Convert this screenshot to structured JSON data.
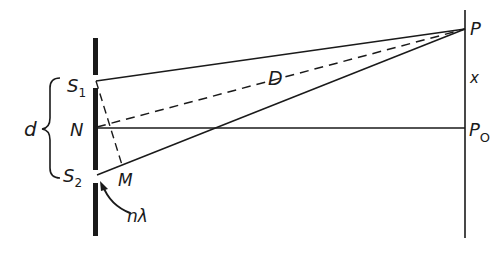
{
  "diagram": {
    "labels": {
      "slit_top": "S",
      "slit_top_sub": "1",
      "slit_bottom": "S",
      "slit_bottom_sub": "2",
      "midpoint": "N",
      "foot": "M",
      "separation": "d",
      "distance": "D",
      "point": "P",
      "center": "P",
      "center_sub": "O",
      "offset": "x",
      "path_diff": "nλ"
    },
    "colors": {
      "ink": "#1a1a1a",
      "background": "#ffffff"
    }
  }
}
